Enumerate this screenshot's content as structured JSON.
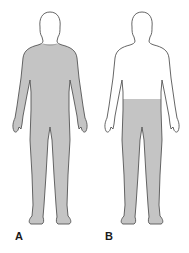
{
  "figures": [
    {
      "id": "A",
      "label": "A",
      "shaded_region": "neck-down (entire body except head)"
    },
    {
      "id": "B",
      "label": "B",
      "shaded_region": "waist-down (lower body and legs)"
    }
  ],
  "colors": {
    "shade": "#c4c4c4",
    "outline": "#555555",
    "background": "#ffffff"
  }
}
